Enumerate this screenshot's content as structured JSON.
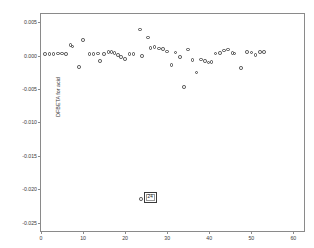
{
  "chart": {
    "title": "",
    "y_axis_label": "DFBETA for acid",
    "x_axis_label": "",
    "y_ticks": [
      "0.005",
      "0.000",
      "-0.005",
      "-0.010",
      "-0.015",
      "-0.020",
      "-0.025"
    ],
    "x_ticks": [
      "0",
      "10",
      "20",
      "30",
      "40",
      "50",
      "60"
    ],
    "annotation_label": "24",
    "frame_color": "#8a8a8a",
    "marker_color": "#4a4a4a"
  },
  "chart_data": {
    "type": "scatter",
    "title": "",
    "xlabel": "",
    "ylabel": "DFBETA for acid",
    "xlim": [
      0,
      63
    ],
    "ylim": [
      -0.0265,
      0.0062
    ],
    "grid": false,
    "legend": "none",
    "xticks": [
      0,
      10,
      20,
      30,
      40,
      50,
      60
    ],
    "yticks": [
      0.005,
      0.0,
      -0.005,
      -0.01,
      -0.015,
      -0.02,
      -0.025
    ],
    "marker": "open-circle",
    "x": [
      1,
      2,
      3,
      4,
      5,
      6,
      7,
      7.5,
      9,
      10,
      11.5,
      12.5,
      13.5,
      14,
      15,
      16,
      16.8,
      17.5,
      18.3,
      19,
      20,
      21,
      22,
      23.5,
      24,
      25.5,
      26,
      27,
      28,
      29,
      30,
      31,
      32,
      33,
      34,
      35,
      36,
      37,
      38,
      39,
      39.8,
      40.5,
      41.5,
      42.5,
      43.5,
      44.5,
      45.5,
      46,
      47.5,
      49,
      50,
      51,
      52,
      53
    ],
    "y": [
      0.00022,
      0.00022,
      0.00025,
      0.0003,
      0.00028,
      0.00025,
      0.00155,
      0.00135,
      -0.00175,
      0.0023,
      0.00022,
      0.00025,
      0.0003,
      -0.00085,
      0.00025,
      0.0005,
      0.00055,
      0.0004,
      0.0001,
      -0.0002,
      -0.0005,
      0.0002,
      0.00022,
      0.0039,
      -0.0001,
      0.0027,
      0.0011,
      0.00125,
      0.00105,
      0.001,
      0.0006,
      -0.00145,
      0.00045,
      -0.00025,
      -0.0047,
      0.0009,
      -0.0007,
      -0.00255,
      -0.0006,
      -0.00085,
      -0.00105,
      -0.00095,
      0.0003,
      0.00035,
      0.00075,
      0.0009,
      0.00035,
      0.0003,
      -0.0019,
      0.0005,
      0.00048,
      0.00012,
      0.0005,
      0.00055
    ],
    "annotated_points": [
      {
        "label": "24",
        "x": 23.8,
        "y": -0.02145
      }
    ],
    "note": "SPSS casewise DFBETA diagnostic scatter; case 24 is an extreme low outlier labelled in a box."
  }
}
